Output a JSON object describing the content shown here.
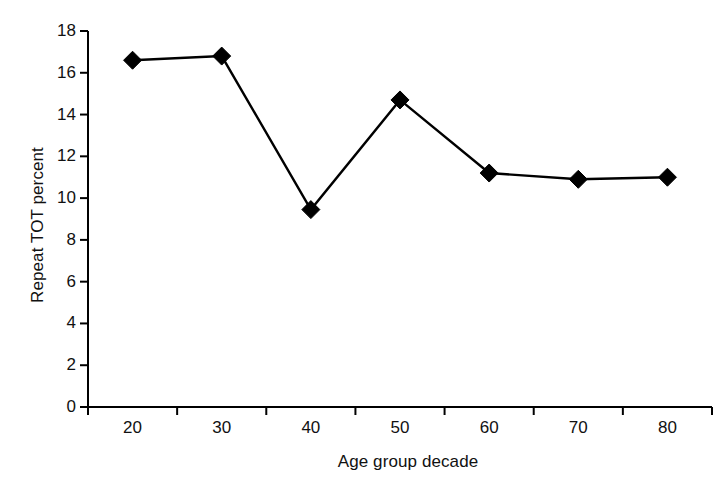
{
  "chart_data": {
    "type": "line",
    "title": "",
    "subtitle": "",
    "xlabel": "Age group decade",
    "ylabel": "Repeat TOT percent",
    "categories": [
      "20",
      "30",
      "40",
      "50",
      "60",
      "70",
      "80"
    ],
    "values": [
      16.6,
      16.8,
      9.45,
      14.7,
      11.2,
      10.9,
      11.0
    ],
    "series": [
      {
        "name": "Repeat TOT percent",
        "values": [
          16.6,
          16.8,
          9.45,
          14.7,
          11.2,
          10.9,
          11.0
        ]
      }
    ],
    "ylim": [
      0,
      18
    ],
    "yticks": [
      0,
      2,
      4,
      6,
      8,
      10,
      12,
      14,
      16,
      18
    ],
    "ytick_labels": [
      "0",
      "2",
      "4",
      "6",
      "8",
      "10",
      "12",
      "14",
      "16",
      "18"
    ],
    "xtick_labels": [
      "20",
      "30",
      "40",
      "50",
      "60",
      "70",
      "80"
    ],
    "grid": false,
    "legend": false,
    "legend_position": "none",
    "marker": "diamond",
    "line_color": "#000000",
    "marker_color": "#000000",
    "axis_color": "#000000",
    "background_color": "#ffffff"
  }
}
